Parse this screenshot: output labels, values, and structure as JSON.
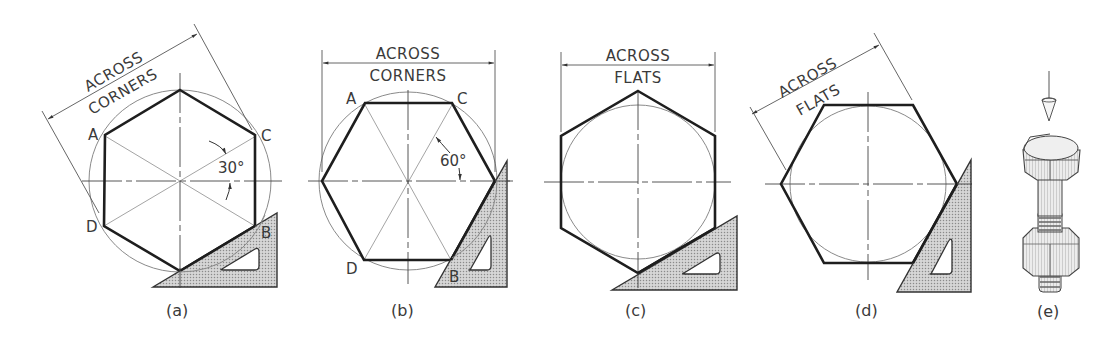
{
  "figure": {
    "colors": {
      "line": "#1e1e1e",
      "construction": "#9a9a9a",
      "triangle_fill": "#c8c8c8",
      "background": "#ffffff"
    },
    "panels": [
      {
        "id": "a",
        "caption": "(a)",
        "dimension_line1": "ACROSS",
        "dimension_line2": "CORNERS",
        "angle_label": "30°",
        "vertex_labels": {
          "A": "A",
          "B": "B",
          "C": "C",
          "D": "D"
        }
      },
      {
        "id": "b",
        "caption": "(b)",
        "dimension_line1": "ACROSS",
        "dimension_line2": "CORNERS",
        "angle_label": "60°",
        "vertex_labels": {
          "A": "A",
          "B": "B",
          "C": "C",
          "D": "D"
        }
      },
      {
        "id": "c",
        "caption": "(c)",
        "dimension_line1": "ACROSS",
        "dimension_line2": "FLATS"
      },
      {
        "id": "d",
        "caption": "(d)",
        "dimension_line1": "ACROSS",
        "dimension_line2": "FLATS"
      },
      {
        "id": "e",
        "caption": "(e)",
        "illustration": "hex-bolt-with-nut"
      }
    ]
  }
}
